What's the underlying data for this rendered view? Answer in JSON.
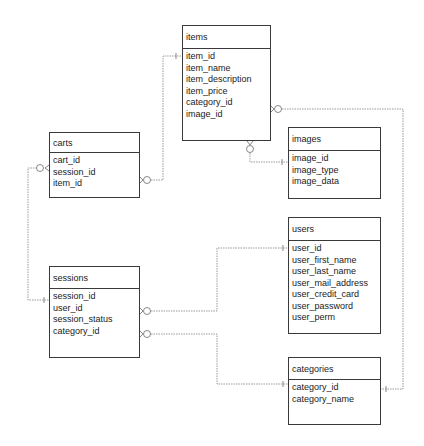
{
  "diagram": {
    "type": "entity-relationship",
    "entities": [
      {
        "id": "items",
        "name": "items",
        "x": 182,
        "y": 25,
        "w": 89,
        "h": 116,
        "hdr": 23,
        "fields": [
          "item_id",
          "item_name",
          "item_description",
          "item_price",
          "category_id",
          "image_id"
        ]
      },
      {
        "id": "carts",
        "name": "carts",
        "x": 49,
        "y": 132,
        "w": 91,
        "h": 66,
        "hdr": 20,
        "fields": [
          "cart_id",
          "session_id",
          "item_id"
        ]
      },
      {
        "id": "images",
        "name": "images",
        "x": 288,
        "y": 127,
        "w": 93,
        "h": 72,
        "hdr": 23,
        "fields": [
          "image_id",
          "image_type",
          "image_data"
        ]
      },
      {
        "id": "users",
        "name": "users",
        "x": 288,
        "y": 217,
        "w": 93,
        "h": 117,
        "hdr": 23,
        "fields": [
          "user_id",
          "user_first_name",
          "user_last_name",
          "user_mail_address",
          "user_credit_card",
          "user_password",
          "user_perm"
        ]
      },
      {
        "id": "sessions",
        "name": "sessions",
        "x": 49,
        "y": 266,
        "w": 91,
        "h": 92,
        "hdr": 22,
        "fields": [
          "session_id",
          "user_id",
          "session_status",
          "category_id"
        ]
      },
      {
        "id": "categories",
        "name": "categories",
        "x": 288,
        "y": 357,
        "w": 93,
        "h": 68,
        "hdr": 22,
        "fields": [
          "category_id",
          "category_name"
        ]
      }
    ],
    "relationships": [
      {
        "from": "carts.item_id",
        "to": "items.item_id",
        "from_card": "zero-or-many",
        "to_card": "one"
      },
      {
        "from": "carts.session_id",
        "to": "sessions.session_id",
        "from_card": "zero-or-many",
        "to_card": "one"
      },
      {
        "from": "items.image_id",
        "to": "images.image_id",
        "from_card": "zero-or-many",
        "to_card": "one"
      },
      {
        "from": "items.category_id",
        "to": "categories.category_id",
        "from_card": "zero-or-many",
        "to_card": "one"
      },
      {
        "from": "sessions.user_id",
        "to": "users.user_id",
        "from_card": "zero-or-many",
        "to_card": "one"
      },
      {
        "from": "sessions.category_id",
        "to": "categories.category_id",
        "from_card": "zero-or-many",
        "to_card": "one"
      }
    ],
    "colors": {
      "border": "#3a3a3a",
      "connector": "#9a9a9a",
      "text": "#1a1a1a",
      "background": "#ffffff"
    }
  }
}
